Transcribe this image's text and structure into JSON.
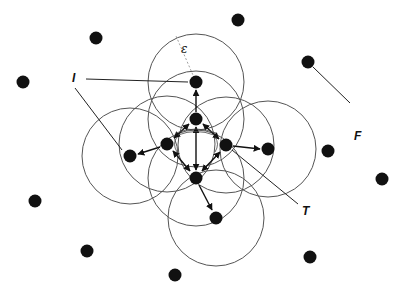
{
  "diagram": {
    "colors": {
      "node": "#111111",
      "circle": "#555555",
      "arrow": "#111111",
      "background": "#ffffff"
    },
    "circle_radius": 48,
    "labels": {
      "epsilon": {
        "text": "ε",
        "x": 181,
        "y": 52
      },
      "I": {
        "text": "I",
        "x": 73,
        "y": 79
      },
      "F": {
        "text": "F",
        "x": 356,
        "y": 137
      },
      "T": {
        "text": "T",
        "x": 303,
        "y": 212
      }
    },
    "cluster_nodes": [
      {
        "id": "top",
        "x": 196,
        "y": 82
      },
      {
        "id": "inner-top",
        "x": 196,
        "y": 119
      },
      {
        "id": "inner-left",
        "x": 167,
        "y": 144
      },
      {
        "id": "inner-right",
        "x": 226,
        "y": 145
      },
      {
        "id": "inner-bottom",
        "x": 196,
        "y": 178
      },
      {
        "id": "outer-left",
        "x": 130,
        "y": 156
      },
      {
        "id": "outer-right",
        "x": 268,
        "y": 149
      },
      {
        "id": "outer-bottom",
        "x": 216,
        "y": 218
      }
    ],
    "noise_nodes": [
      {
        "x": 96,
        "y": 38
      },
      {
        "x": 23,
        "y": 82
      },
      {
        "x": 238,
        "y": 20
      },
      {
        "x": 308,
        "y": 62
      },
      {
        "x": 328,
        "y": 151
      },
      {
        "x": 382,
        "y": 179
      },
      {
        "x": 35,
        "y": 201
      },
      {
        "x": 87,
        "y": 251
      },
      {
        "x": 175,
        "y": 275
      },
      {
        "x": 310,
        "y": 257
      }
    ],
    "circles": [
      {
        "cx": 196,
        "cy": 82
      },
      {
        "cx": 196,
        "cy": 119
      },
      {
        "cx": 167,
        "cy": 144
      },
      {
        "cx": 226,
        "cy": 145
      },
      {
        "cx": 196,
        "cy": 178
      },
      {
        "cx": 130,
        "cy": 156
      },
      {
        "cx": 268,
        "cy": 149
      },
      {
        "cx": 216,
        "cy": 218
      }
    ]
  }
}
